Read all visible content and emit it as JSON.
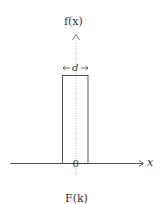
{
  "diagram": {
    "y_axis_label": "f(x)",
    "x_axis_label": "x",
    "origin_label": "0",
    "width_label": "d",
    "caption": "F(k)",
    "colors": {
      "line": "#444444",
      "dotted": "#888888",
      "background": "#ffffff"
    }
  }
}
